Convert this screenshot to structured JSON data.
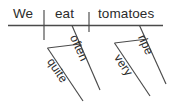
{
  "diagram": {
    "type": "reed-kellogg-sentence-diagram",
    "sentence": "We eat tomatoes often quite very ripe",
    "colors": {
      "line": "#4a4a4a",
      "text": "#2b2b2b",
      "background": "#ffffff"
    },
    "baseline": {
      "subject": "We",
      "verb": "eat",
      "object": "tomatoes"
    },
    "modifiers": {
      "verb_adverb": "often",
      "verb_adverb_intensifier": "quite",
      "object_adjective": "ripe",
      "object_adjective_intensifier": "very"
    }
  }
}
